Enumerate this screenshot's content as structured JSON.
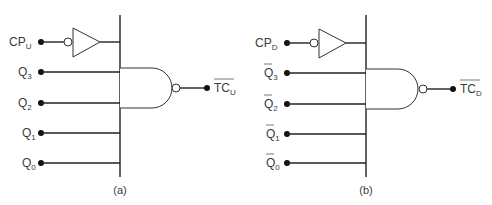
{
  "panels": [
    {
      "id": "a",
      "caption": "(a)",
      "offset_x": 0,
      "clock_input": {
        "base": "CP",
        "sub": "U"
      },
      "inputs": [
        {
          "base": "Q",
          "sub": "3",
          "inverted": false
        },
        {
          "base": "Q",
          "sub": "2",
          "inverted": false
        },
        {
          "base": "Q",
          "sub": "1",
          "inverted": false
        },
        {
          "base": "Q",
          "sub": "0",
          "inverted": false
        }
      ],
      "output": {
        "base": "TC",
        "sub": "U",
        "overbar": true
      }
    },
    {
      "id": "b",
      "caption": "(b)",
      "offset_x": 246,
      "clock_input": {
        "base": "CP",
        "sub": "D"
      },
      "inputs": [
        {
          "base": "Q",
          "sub": "3",
          "inverted": true
        },
        {
          "base": "Q",
          "sub": "2",
          "inverted": true
        },
        {
          "base": "Q",
          "sub": "1",
          "inverted": true
        },
        {
          "base": "Q",
          "sub": "0",
          "inverted": true
        }
      ],
      "output": {
        "base": "TC",
        "sub": "D",
        "overbar": true
      }
    }
  ],
  "colors": {
    "line": "#222222",
    "text": "#3a3a3a"
  }
}
